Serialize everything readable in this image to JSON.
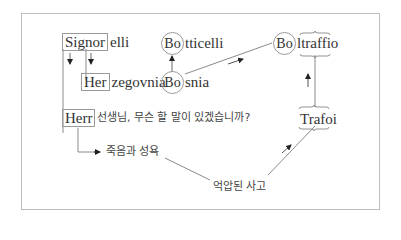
{
  "diagram": {
    "words": {
      "signorelli": {
        "prefix": "Signor",
        "rest": "elli"
      },
      "herzegovina": {
        "prefix": "Her",
        "rest": "zegovnia"
      },
      "herr": {
        "prefix": "Herr",
        "rest": "선생님, 무슨 할 말이 있겠습니까?"
      },
      "botticelli": {
        "prefix": "Bo",
        "rest": "tticelli"
      },
      "bosnia": {
        "prefix": "Bo",
        "rest": "snia"
      },
      "boltraffio": {
        "prefix": "Bo",
        "rest": "ltraffio"
      },
      "trafoi": {
        "label": "Trafoi"
      }
    },
    "labels": {
      "death_sexuality": "죽음과 성욕",
      "repressed_thought": "억압된 사고"
    },
    "colors": {
      "line": "#8a8a8a",
      "frame": "#bdbdbd",
      "text": "#333333"
    }
  }
}
